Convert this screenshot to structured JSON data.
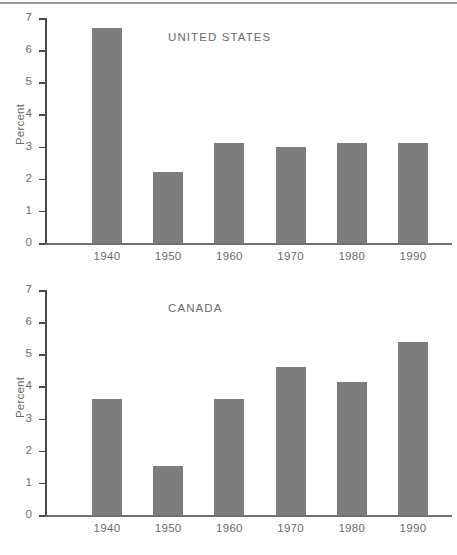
{
  "figure": {
    "rule_color": "#9a9a9a",
    "bar_color": "#7d7d7d",
    "axis_color": "#4a4a4a",
    "text_color": "#6b6b6b"
  },
  "chart_data": [
    {
      "type": "bar",
      "title": "UNITED STATES",
      "xlabel": "",
      "ylabel": "Percent",
      "categories": [
        "1940",
        "1950",
        "1960",
        "1970",
        "1980",
        "1990"
      ],
      "values": [
        6.7,
        2.2,
        3.1,
        3.0,
        3.1,
        3.1
      ],
      "ylim": [
        0,
        7
      ],
      "yticks": [
        0,
        1,
        2,
        3,
        4,
        5,
        6,
        7
      ],
      "ytick_labels": [
        "0",
        "1",
        "2",
        "3",
        "4",
        "5",
        "6",
        "7"
      ],
      "grid": false,
      "legend": "none"
    },
    {
      "type": "bar",
      "title": "CANADA",
      "xlabel": "",
      "ylabel": "Percent",
      "categories": [
        "1940",
        "1950",
        "1960",
        "1970",
        "1980",
        "1990"
      ],
      "values": [
        3.62,
        1.52,
        3.6,
        4.62,
        4.13,
        5.38
      ],
      "ylim": [
        0,
        7
      ],
      "yticks": [
        0,
        1,
        2,
        3,
        4,
        5,
        6,
        7
      ],
      "ytick_labels": [
        "0",
        "1",
        "2",
        "3",
        "4",
        "5",
        "6",
        "7"
      ],
      "grid": false,
      "legend": "none"
    }
  ]
}
